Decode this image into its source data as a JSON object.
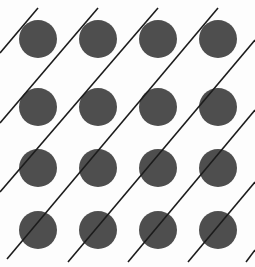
{
  "figure": {
    "name": "diagonal-lines-and-dots-illusion",
    "width": 255,
    "height": 267,
    "background_color": "#fdfdfd",
    "dot_color": "#4e4e4e",
    "line_color": "#1c1c1c",
    "line_width": 1.6,
    "dot_radius": 19,
    "title": "",
    "caption": "",
    "labels": []
  },
  "chart_data": {
    "type": "scatter",
    "title": "",
    "subtitle": "",
    "xlabel": "",
    "ylabel": "",
    "xlim": [
      0,
      255
    ],
    "ylim": [
      0,
      267
    ],
    "grid": false,
    "legend": null,
    "annotations": [],
    "series": [
      {
        "name": "dots",
        "marker": "circle",
        "marker_size": 38,
        "color": "#4e4e4e",
        "columns": [
          38,
          98,
          158,
          218
        ],
        "rows": [
          39,
          107,
          168,
          230
        ],
        "points": [
          {
            "x": 38,
            "y": 39,
            "row": 1,
            "col": 1
          },
          {
            "x": 98,
            "y": 39,
            "row": 1,
            "col": 2
          },
          {
            "x": 158,
            "y": 39,
            "row": 1,
            "col": 3
          },
          {
            "x": 218,
            "y": 39,
            "row": 1,
            "col": 4
          },
          {
            "x": 38,
            "y": 107,
            "row": 2,
            "col": 1
          },
          {
            "x": 98,
            "y": 107,
            "row": 2,
            "col": 2
          },
          {
            "x": 158,
            "y": 107,
            "row": 2,
            "col": 3
          },
          {
            "x": 218,
            "y": 107,
            "row": 2,
            "col": 4
          },
          {
            "x": 38,
            "y": 168,
            "row": 3,
            "col": 1
          },
          {
            "x": 98,
            "y": 168,
            "row": 3,
            "col": 2
          },
          {
            "x": 158,
            "y": 168,
            "row": 3,
            "col": 3
          },
          {
            "x": 218,
            "y": 168,
            "row": 3,
            "col": 4
          },
          {
            "x": 38,
            "y": 230,
            "row": 4,
            "col": 1
          },
          {
            "x": 98,
            "y": 230,
            "row": 4,
            "col": 2
          },
          {
            "x": 158,
            "y": 230,
            "row": 4,
            "col": 3
          },
          {
            "x": 218,
            "y": 230,
            "row": 4,
            "col": 4
          }
        ]
      },
      {
        "name": "diagonal-lines",
        "marker": "line",
        "color": "#1c1c1c",
        "angle_degrees": 45,
        "segments": [
          {
            "id": 1,
            "x1": 0,
            "y1": 123,
            "x2": 98,
            "y2": 8
          },
          {
            "id": 2,
            "x1": 0,
            "y1": 192,
            "x2": 158,
            "y2": 8
          },
          {
            "id": 3,
            "x1": 7,
            "y1": 259,
            "x2": 218,
            "y2": 8
          },
          {
            "id": 4,
            "x1": 68,
            "y1": 262,
            "x2": 255,
            "y2": 40
          },
          {
            "id": 5,
            "x1": 128,
            "y1": 262,
            "x2": 255,
            "y2": 110
          },
          {
            "id": 6,
            "x1": 188,
            "y1": 262,
            "x2": 255,
            "y2": 182
          },
          {
            "id": 7,
            "x1": 0,
            "y1": 53,
            "x2": 38,
            "y2": 8
          },
          {
            "id": 8,
            "x1": 246,
            "y1": 262,
            "x2": 255,
            "y2": 250
          }
        ]
      }
    ]
  }
}
